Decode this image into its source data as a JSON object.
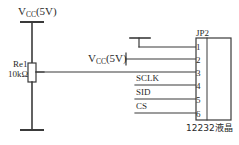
{
  "diagram": {
    "stroke_color": "#3a3a3a",
    "text_color": "#2a2a2a",
    "background": "#ffffff"
  },
  "power": {
    "top_rail_label": "V",
    "top_rail_sub": "CC",
    "top_rail_value": "(5V)",
    "mid_rail_label": "V",
    "mid_rail_sub": "CC",
    "mid_rail_value": "(5V)"
  },
  "resistor": {
    "reference": "Re1",
    "value": "10kΩ"
  },
  "connector": {
    "designator": "JP2",
    "device_label": "12232液晶",
    "pins": [
      {
        "number": "1",
        "net": ""
      },
      {
        "number": "2",
        "net": ""
      },
      {
        "number": "3",
        "net": ""
      },
      {
        "number": "4",
        "net": "SCLK"
      },
      {
        "number": "5",
        "net": "SID"
      },
      {
        "number": "6",
        "net": "CS"
      }
    ]
  },
  "signals": {
    "sclk": "SCLK",
    "sid": "SID",
    "cs": "CS"
  }
}
